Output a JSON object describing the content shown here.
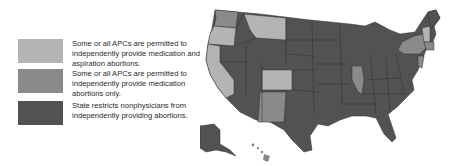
{
  "colors": {
    "light": "#b4b4b4",
    "medium": "#8a8a8a",
    "dark": "#525252",
    "background": "#ffffff"
  },
  "legend": {
    "items": [
      {
        "key": "light",
        "label": "Some or all APCs are permitted to independently provide medication and aspiration abortions."
      },
      {
        "key": "medium",
        "label": "Some or all APCs are permitted to independently provide medication abortions only."
      },
      {
        "key": "dark",
        "label": "State restricts nonphysicians from independently providing abortions."
      }
    ]
  },
  "map": {
    "region": "United States",
    "state_categories": {
      "light": [
        "Washington-west (partial)",
        "Oregon",
        "California",
        "Montana",
        "Colorado",
        "Vermont",
        "New Hampshire (partial)"
      ],
      "medium": [
        "Washington",
        "New Mexico",
        "Illinois",
        "New York",
        "Massachusetts",
        "Connecticut",
        "New Jersey",
        "Hawaii"
      ],
      "dark": [
        "all other states",
        "Alaska",
        "Maine"
      ]
    }
  }
}
